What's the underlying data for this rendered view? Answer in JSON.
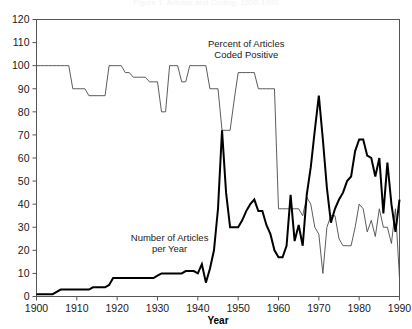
{
  "chart_data": {
    "type": "line",
    "title": "Figure 1. Articles and Coding, 1900-1990",
    "xlabel": "Year",
    "ylabel": "",
    "xlim": [
      1900,
      1990
    ],
    "ylim": [
      0,
      120
    ],
    "grid": false,
    "legend_position": "inline-annotation",
    "xticks": [
      1900,
      1910,
      1920,
      1930,
      1940,
      1950,
      1960,
      1970,
      1980,
      1990
    ],
    "yticks": [
      0,
      10,
      20,
      30,
      40,
      50,
      60,
      70,
      80,
      90,
      100,
      110,
      120
    ],
    "annotations": [
      {
        "text_line1": "Percent of Articles",
        "text_line2": "Coded Positive",
        "x": 1952,
        "y": 108
      },
      {
        "text_line1": "Number of Articles",
        "text_line2": "per Year",
        "x": 1933,
        "y": 24
      }
    ],
    "x": [
      1900,
      1901,
      1902,
      1903,
      1904,
      1905,
      1906,
      1907,
      1908,
      1909,
      1910,
      1911,
      1912,
      1913,
      1914,
      1915,
      1916,
      1917,
      1918,
      1919,
      1920,
      1921,
      1922,
      1923,
      1924,
      1925,
      1926,
      1927,
      1928,
      1929,
      1930,
      1931,
      1932,
      1933,
      1934,
      1935,
      1936,
      1937,
      1938,
      1939,
      1940,
      1941,
      1942,
      1943,
      1944,
      1945,
      1946,
      1947,
      1948,
      1949,
      1950,
      1951,
      1952,
      1953,
      1954,
      1955,
      1956,
      1957,
      1958,
      1959,
      1960,
      1961,
      1962,
      1963,
      1964,
      1965,
      1966,
      1967,
      1968,
      1969,
      1970,
      1971,
      1972,
      1973,
      1974,
      1975,
      1976,
      1977,
      1978,
      1979,
      1980,
      1981,
      1982,
      1983,
      1984,
      1985,
      1986,
      1987,
      1988,
      1989,
      1990
    ],
    "series": [
      {
        "name": "Percent of Articles Coded Positive",
        "style": "thin",
        "values": [
          100,
          100,
          100,
          100,
          100,
          100,
          100,
          100,
          100,
          90,
          90,
          90,
          90,
          87,
          87,
          87,
          87,
          87,
          100,
          100,
          100,
          100,
          97,
          97,
          95,
          95,
          95,
          95,
          93,
          93,
          93,
          80,
          80,
          100,
          100,
          100,
          93,
          93,
          100,
          100,
          100,
          100,
          100,
          90,
          90,
          90,
          72,
          72,
          72,
          85,
          97,
          97,
          97,
          97,
          97,
          90,
          90,
          90,
          90,
          90,
          38,
          38,
          38,
          38,
          38,
          38,
          35,
          43,
          40,
          30,
          27,
          10,
          30,
          35,
          35,
          25,
          22,
          22,
          22,
          30,
          40,
          38,
          28,
          33,
          26,
          38,
          30,
          30,
          23,
          38,
          8
        ]
      },
      {
        "name": "Number of Articles per Year",
        "style": "thick",
        "values": [
          1,
          1,
          1,
          1,
          1,
          2,
          3,
          3,
          3,
          3,
          3,
          3,
          3,
          3,
          4,
          4,
          4,
          4,
          5,
          8,
          8,
          8,
          8,
          8,
          8,
          8,
          8,
          8,
          8,
          8,
          9,
          10,
          10,
          10,
          10,
          10,
          10,
          11,
          11,
          11,
          10,
          14,
          6,
          12,
          20,
          38,
          72,
          45,
          30,
          30,
          30,
          33,
          37,
          40,
          42,
          37,
          37,
          31,
          27,
          20,
          17,
          17,
          22,
          44,
          24,
          31,
          22,
          44,
          56,
          72,
          87,
          68,
          47,
          32,
          38,
          42,
          45,
          50,
          52,
          63,
          68,
          68,
          61,
          60,
          52,
          60,
          36,
          58,
          40,
          28,
          42
        ]
      }
    ]
  }
}
